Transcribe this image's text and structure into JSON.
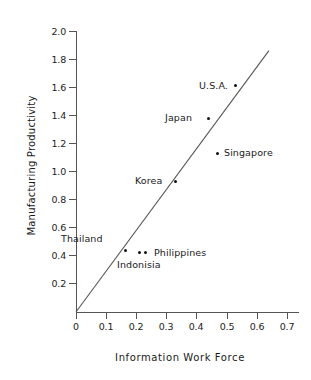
{
  "chart_data": {
    "type": "scatter",
    "title": "",
    "xlabel": "Information Work Force",
    "ylabel": "Manufacturing Productivity",
    "xlim": [
      0,
      0.74
    ],
    "ylim": [
      0,
      2.05
    ],
    "xticks": [
      "0",
      "0.1",
      "0.2",
      "0.3",
      "0.4",
      "0.5",
      "0.6",
      "0.7"
    ],
    "xtick_values": [
      0,
      0.1,
      0.2,
      0.3,
      0.4,
      0.5,
      0.6,
      0.7
    ],
    "yticks": [
      "0.2",
      "0.4",
      "0.6",
      "0.8",
      "1.0",
      "1.2",
      "1.4",
      "1.6",
      "1.8",
      "2.0"
    ],
    "ytick_values": [
      0.2,
      0.4,
      0.6,
      0.8,
      1.0,
      1.2,
      1.4,
      1.6,
      1.8,
      2.0
    ],
    "grid": false,
    "legend": false,
    "marker_color": "#111111",
    "line_color": "#555555",
    "points": [
      {
        "label": "U.S.A.",
        "x": 0.53,
        "y": 1.61,
        "label_position": "left"
      },
      {
        "label": "Japan",
        "x": 0.44,
        "y": 1.38,
        "label_position": "left"
      },
      {
        "label": "Singapore",
        "x": 0.47,
        "y": 1.13,
        "label_position": "right"
      },
      {
        "label": "Korea",
        "x": 0.33,
        "y": 0.93,
        "label_position": "left"
      },
      {
        "label": "Thailand",
        "x": 0.165,
        "y": 0.44,
        "label_position": "above-left"
      },
      {
        "label": "Indonisia",
        "x": 0.21,
        "y": 0.42,
        "label_position": "below"
      },
      {
        "label": "Philippines",
        "x": 0.23,
        "y": 0.42,
        "label_position": "right"
      }
    ],
    "trend_line": {
      "x_start": 0.0,
      "y_start": 0.0,
      "x_end": 0.64,
      "y_end": 1.86
    }
  }
}
